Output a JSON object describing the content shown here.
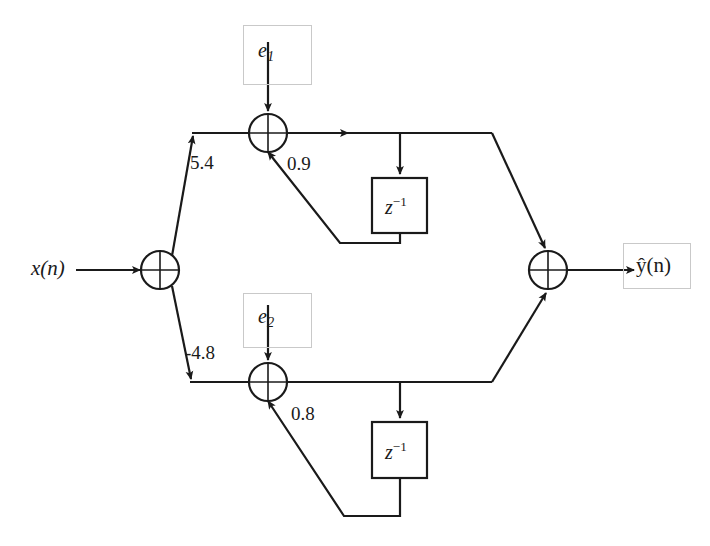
{
  "diagram": {
    "type": "signal-flow-diagram",
    "colors": {
      "line": "#1a1a1a",
      "box_border": "#c9c9c9",
      "background": "#ffffff",
      "text": "#1a1a1a"
    },
    "inputs": [
      {
        "name": "x-input",
        "label": "x(n)"
      }
    ],
    "outputs": [
      {
        "name": "y-hat-output",
        "label": "ŷ(n)"
      }
    ],
    "noise_sources": [
      {
        "name": "e1-source",
        "label": "e",
        "subscript": "1"
      },
      {
        "name": "e2-source",
        "label": "e",
        "subscript": "2"
      }
    ],
    "gains": [
      {
        "name": "forward-gain-upper",
        "value": "5.4"
      },
      {
        "name": "feedback-gain-upper",
        "value": "0.9"
      },
      {
        "name": "forward-gain-lower",
        "value": "-4.8"
      },
      {
        "name": "feedback-gain-lower",
        "value": "0.8"
      }
    ],
    "delay_blocks": [
      {
        "name": "delay-upper",
        "label": "z",
        "exponent": "−1"
      },
      {
        "name": "delay-lower",
        "label": "z",
        "exponent": "−1"
      }
    ],
    "adders": [
      {
        "name": "adder-input",
        "symbol": "⊕"
      },
      {
        "name": "adder-upper-branch",
        "symbol": "⊕"
      },
      {
        "name": "adder-lower-branch",
        "symbol": "⊕"
      },
      {
        "name": "adder-output",
        "symbol": "⊕"
      }
    ]
  }
}
